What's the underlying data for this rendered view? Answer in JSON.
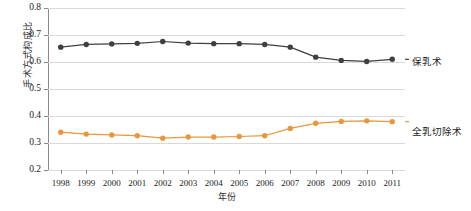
{
  "chart_data": {
    "type": "line",
    "title": "",
    "xlabel": "年份",
    "ylabel": "手术方式构成比",
    "grid": true,
    "legend_position": "right",
    "xlim": [
      1997.5,
      2011.5
    ],
    "ylim": [
      0.2,
      0.8
    ],
    "ytick_labels": [
      "0.8",
      "0.7",
      "0.6",
      "0.5",
      "0.4",
      "0.3",
      "0.2"
    ],
    "ytick_values": [
      0.8,
      0.7,
      0.6,
      0.5,
      0.4,
      0.3,
      0.2
    ],
    "categories": [
      1998,
      1999,
      2000,
      2001,
      2002,
      2003,
      2004,
      2005,
      2006,
      2007,
      2008,
      2009,
      2010,
      2011
    ],
    "xtick_labels": [
      "1998",
      "1999",
      "2000",
      "2001",
      "2002",
      "2003",
      "2004",
      "2005",
      "2006",
      "2007",
      "2008",
      "2009",
      "2010",
      "2011"
    ],
    "series": [
      {
        "name": "保乳术",
        "color": "#3f3f3f",
        "marker": "circle",
        "values": [
          0.655,
          0.665,
          0.667,
          0.669,
          0.676,
          0.67,
          0.668,
          0.668,
          0.665,
          0.655,
          0.618,
          0.606,
          0.602,
          0.61
        ]
      },
      {
        "name": "全乳切除术",
        "color": "#e8973a",
        "marker": "circle",
        "values": [
          0.34,
          0.333,
          0.33,
          0.327,
          0.318,
          0.322,
          0.322,
          0.324,
          0.327,
          0.354,
          0.373,
          0.38,
          0.382,
          0.379
        ]
      }
    ]
  },
  "legend": {
    "top_label": "保乳术",
    "bottom_label": "全乳切除术"
  }
}
